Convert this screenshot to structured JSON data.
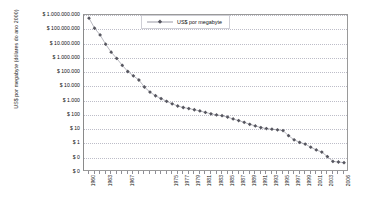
{
  "chart_data": {
    "type": "line",
    "title": "",
    "xlabel": "",
    "ylabel": "US$ por megabyte (dólares do ano 2000)",
    "yscale": "log",
    "ylim": [
      1,
      1000000000
    ],
    "xlim": [
      1960,
      2006
    ],
    "grid": true,
    "legend_position": "top-right",
    "y_tick_labels": [
      "$ 1.000.000.000",
      "$ 100.000.000",
      "$ 10.000.000",
      "$ 1.000.000",
      "$ 100.000",
      "$ 10.000",
      "$ 1.000",
      "$ 100",
      "$ 10",
      "$ 1",
      "$ 0",
      "$ 0"
    ],
    "y_tick_values": [
      1000000000,
      100000000,
      10000000,
      1000000,
      100000,
      10000,
      1000,
      100,
      10,
      1,
      0.1,
      0.01
    ],
    "x_tick_labels": [
      "1960",
      "1963",
      "1967",
      "1975",
      "1977",
      "1979",
      "1981",
      "1983",
      "1985",
      "1987",
      "1989",
      "1991",
      "1993",
      "1995",
      "1997",
      "1999",
      "2001",
      "2003",
      "2006"
    ],
    "series": [
      {
        "name": "US$ por megabyte",
        "color": "#56565f",
        "marker": "diamond",
        "x": [
          1960,
          1961,
          1962,
          1963,
          1964,
          1965,
          1966,
          1967,
          1968,
          1969,
          1970,
          1971,
          1972,
          1973,
          1974,
          1975,
          1976,
          1977,
          1978,
          1979,
          1980,
          1981,
          1982,
          1983,
          1984,
          1985,
          1986,
          1987,
          1988,
          1989,
          1990,
          1991,
          1992,
          1993,
          1994,
          1995,
          1996,
          1997,
          1998,
          1999,
          2000,
          2001,
          2002,
          2003,
          2004,
          2005,
          2006
        ],
        "values": [
          600000000,
          120000000,
          40000000,
          9000000,
          2500000,
          900000,
          300000,
          110000,
          55000,
          28000,
          9000,
          4000,
          2200,
          1400,
          900,
          600,
          420,
          330,
          280,
          230,
          190,
          150,
          120,
          100,
          88,
          70,
          52,
          40,
          30,
          22,
          17,
          13,
          11,
          10,
          9,
          8,
          3.5,
          1.8,
          1.2,
          0.9,
          0.55,
          0.35,
          0.25,
          0.12,
          0.055,
          0.05,
          0.045
        ]
      }
    ]
  },
  "legend": {
    "label": "US$ por megabyte"
  }
}
